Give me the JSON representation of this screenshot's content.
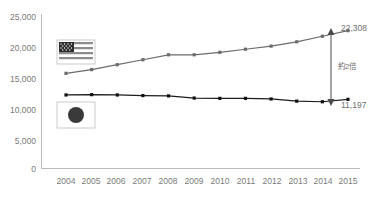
{
  "chart_data": {
    "type": "line",
    "title": "",
    "xlabel": "",
    "ylabel": "",
    "categories": [
      "2004",
      "2005",
      "2006",
      "2007",
      "2008",
      "2009",
      "2010",
      "2011",
      "2012",
      "2013",
      "2014",
      "2015"
    ],
    "ylim": [
      0,
      25000
    ],
    "ytick_labels": [
      "0",
      "5,000",
      "10,000",
      "15,000",
      "20,000",
      "25,000"
    ],
    "ytick_values": [
      0,
      5000,
      10000,
      15000,
      20000,
      25000
    ],
    "grid": false,
    "legend_position": "inside-left",
    "series": [
      {
        "name": "United States",
        "icon": "flag-usa-icon",
        "color": "#6b6b6b",
        "values": [
          15400,
          16000,
          16800,
          17600,
          18400,
          18400,
          18800,
          19300,
          19800,
          20500,
          21400,
          22308
        ],
        "end_label": "22,308"
      },
      {
        "name": "Japan",
        "icon": "flag-japan-icon",
        "color": "#111111",
        "values": [
          11900,
          11950,
          11900,
          11800,
          11750,
          11400,
          11350,
          11350,
          11250,
          10900,
          10800,
          11197
        ],
        "end_label": "11,197"
      }
    ],
    "annotations": [
      {
        "name": "ratio-annotation",
        "text": "約2倍",
        "kind": "double-arrow",
        "from_value": 22308,
        "to_value": 11197
      }
    ]
  }
}
